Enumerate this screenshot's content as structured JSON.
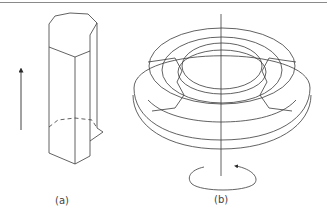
{
  "figure": {
    "panels": [
      {
        "id": "a",
        "label": "(a)",
        "subject": "hexagonal-prism-with-translation-arrow"
      },
      {
        "id": "b",
        "label": "(b)",
        "subject": "faceted-torus-with-rotation-axis"
      }
    ],
    "colors": {
      "line": "#3a3a3a",
      "rule": "#8a8a8a",
      "background": "#ffffff"
    }
  }
}
